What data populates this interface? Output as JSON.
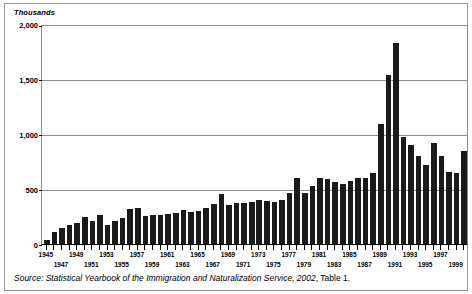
{
  "figure": {
    "axis_title": "Thousands",
    "source_prefix": "Source: Statistical Yearbook of the Immigration and Naturalization Service, 2002",
    "source_suffix": ", Table 1."
  },
  "colors": {
    "bar": "#1a1a1a",
    "gridline": "#8c8c8c",
    "axis": "#000000",
    "frame": "#9a9a9a",
    "background": "#ffffff"
  },
  "chart_data": {
    "type": "bar",
    "title": "",
    "subtitle": "",
    "xlabel": "",
    "ylabel": "Thousands",
    "ylim": [
      0,
      2000
    ],
    "yticks": [
      0,
      500,
      1000,
      1500,
      2000
    ],
    "ytick_labels": [
      "0",
      "500",
      "1,000",
      "1,500",
      "2,000"
    ],
    "grid": true,
    "legend": null,
    "categories": [
      "1945",
      "1946",
      "1947",
      "1948",
      "1949",
      "1950",
      "1951",
      "1952",
      "1953",
      "1954",
      "1955",
      "1956",
      "1957",
      "1958",
      "1959",
      "1960",
      "1961",
      "1962",
      "1963",
      "1964",
      "1965",
      "1966",
      "1967",
      "1968",
      "1969",
      "1970",
      "1971",
      "1972",
      "1973",
      "1974",
      "1975",
      "1976",
      "1977",
      "1978",
      "1979",
      "1980",
      "1981",
      "1982",
      "1983",
      "1984",
      "1985",
      "1986",
      "1987",
      "1988",
      "1989",
      "1990",
      "1991",
      "1992",
      "1993",
      "1994",
      "1995",
      "1996",
      "1997",
      "1998",
      "1999",
      "2000"
    ],
    "values": [
      38,
      108,
      147,
      170,
      188,
      249,
      206,
      266,
      170,
      208,
      238,
      322,
      327,
      253,
      261,
      265,
      271,
      284,
      306,
      292,
      297,
      323,
      362,
      454,
      359,
      373,
      370,
      385,
      400,
      395,
      386,
      399,
      462,
      601,
      460,
      531,
      597,
      594,
      560,
      544,
      570,
      602,
      602,
      643,
      1091,
      1536,
      1827,
      974,
      904,
      804,
      721,
      916,
      798,
      654,
      647,
      850
    ],
    "xtick_labels": [
      {
        "category": "1945",
        "label": "1945",
        "row": 0
      },
      {
        "category": "1947",
        "label": "1947",
        "row": 1
      },
      {
        "category": "1949",
        "label": "1949",
        "row": 0
      },
      {
        "category": "1951",
        "label": "1951",
        "row": 1
      },
      {
        "category": "1953",
        "label": "1953",
        "row": 0
      },
      {
        "category": "1955",
        "label": "1955",
        "row": 1
      },
      {
        "category": "1957",
        "label": "1957",
        "row": 0
      },
      {
        "category": "1959",
        "label": "1959",
        "row": 1
      },
      {
        "category": "1961",
        "label": "1961",
        "row": 0
      },
      {
        "category": "1963",
        "label": "1963",
        "row": 1
      },
      {
        "category": "1965",
        "label": "1965",
        "row": 0
      },
      {
        "category": "1967",
        "label": "1967",
        "row": 1
      },
      {
        "category": "1969",
        "label": "1969",
        "row": 0
      },
      {
        "category": "1971",
        "label": "1971",
        "row": 1
      },
      {
        "category": "1973",
        "label": "1973",
        "row": 0
      },
      {
        "category": "1975",
        "label": "1975",
        "row": 1
      },
      {
        "category": "1977",
        "label": "1977",
        "row": 0
      },
      {
        "category": "1979",
        "label": "1979",
        "row": 1
      },
      {
        "category": "1981",
        "label": "1981",
        "row": 0
      },
      {
        "category": "1983",
        "label": "1983",
        "row": 1
      },
      {
        "category": "1985",
        "label": "1985",
        "row": 0
      },
      {
        "category": "1987",
        "label": "1987",
        "row": 1
      },
      {
        "category": "1989",
        "label": "1989",
        "row": 0
      },
      {
        "category": "1991",
        "label": "1991",
        "row": 1
      },
      {
        "category": "1993",
        "label": "1993",
        "row": 0
      },
      {
        "category": "1995",
        "label": "1995",
        "row": 1
      },
      {
        "category": "1997",
        "label": "1997",
        "row": 0
      },
      {
        "category": "1999",
        "label": "1999",
        "row": 1
      }
    ]
  }
}
